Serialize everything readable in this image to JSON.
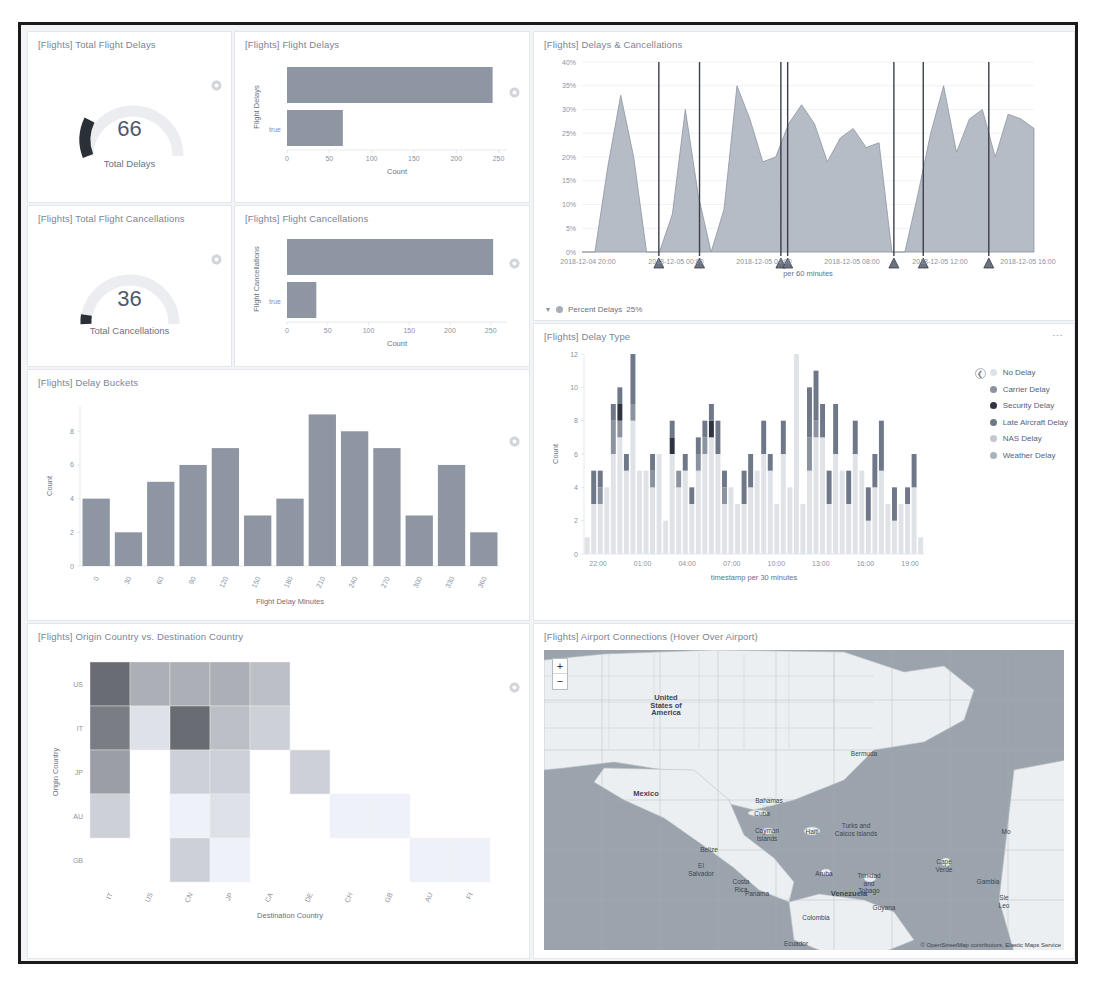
{
  "dashboard": {
    "attribution": "© OpenStreetMap contributors, Elastic Maps Service"
  },
  "panels": {
    "total_delays": {
      "title": "[Flights] Total Flight Delays",
      "value": "66",
      "label": "Total Delays",
      "gear_icon": "gear-icon"
    },
    "total_cancellations": {
      "title": "[Flights] Total Flight Cancellations",
      "value": "36",
      "label": "Total Cancellations",
      "gear_icon": "gear-icon"
    },
    "flight_delays": {
      "title": "[Flights] Flight Delays",
      "gear_icon": "gear-icon"
    },
    "flight_cancellations": {
      "title": "[Flights] Flight Cancellations",
      "gear_icon": "gear-icon"
    },
    "delays_cancellations": {
      "title": "[Flights] Delays & Cancellations",
      "legend_label": "Percent Delays",
      "legend_value": "25%",
      "chevron_icon": "chevron-down-icon"
    },
    "delay_type": {
      "title": "[Flights] Delay Type",
      "menu_icon": "panel-menu-icon"
    },
    "delay_buckets": {
      "title": "[Flights] Delay Buckets",
      "gear_icon": "gear-icon"
    },
    "origin_dest": {
      "title": "[Flights] Origin Country vs. Destination Country",
      "gear_icon": "gear-icon"
    },
    "airport_connections": {
      "title": "[Flights] Airport Connections (Hover Over Airport)",
      "zoom_in": "+",
      "zoom_out": "−",
      "zoom_in_icon": "zoom-in-icon",
      "zoom_out_icon": "zoom-out-icon"
    }
  },
  "map_labels": [
    {
      "text": "United\nStates of\nAmerica",
      "x": 122,
      "y": 44,
      "big": true
    },
    {
      "text": "Mexico",
      "x": 102,
      "y": 140,
      "big": true
    },
    {
      "text": "Bermuda",
      "x": 320,
      "y": 100,
      "big": false
    },
    {
      "text": "Bahamas",
      "x": 225,
      "y": 147,
      "big": false
    },
    {
      "text": "Cuba",
      "x": 218,
      "y": 160,
      "big": false
    },
    {
      "text": "Cayman\nIslands",
      "x": 223,
      "y": 177,
      "big": false
    },
    {
      "text": "Haiti",
      "x": 268,
      "y": 178,
      "big": false
    },
    {
      "text": "Belize",
      "x": 165,
      "y": 196,
      "big": false
    },
    {
      "text": "Turks and\nCaicos Islands",
      "x": 312,
      "y": 172,
      "big": false
    },
    {
      "text": "El\nSalvador",
      "x": 157,
      "y": 212,
      "big": false
    },
    {
      "text": "Costa\nRica",
      "x": 197,
      "y": 228,
      "big": false
    },
    {
      "text": "Panama",
      "x": 213,
      "y": 240,
      "big": false
    },
    {
      "text": "Aruba",
      "x": 280,
      "y": 220,
      "big": false
    },
    {
      "text": "Trinidad\nand\nTobago",
      "x": 325,
      "y": 222,
      "big": false
    },
    {
      "text": "Venezuela",
      "x": 305,
      "y": 240,
      "big": true
    },
    {
      "text": "Colombia",
      "x": 272,
      "y": 264,
      "big": false
    },
    {
      "text": "Guyana",
      "x": 340,
      "y": 254,
      "big": false
    },
    {
      "text": "Ecuador",
      "x": 252,
      "y": 290,
      "big": false
    },
    {
      "text": "Cape\nVerde",
      "x": 400,
      "y": 208,
      "big": false
    },
    {
      "text": "Gambia",
      "x": 444,
      "y": 228,
      "big": false
    },
    {
      "text": "Mo",
      "x": 462,
      "y": 178,
      "big": false
    },
    {
      "text": "Sie\nLeo",
      "x": 460,
      "y": 244,
      "big": false
    }
  ],
  "chart_data": [
    {
      "id": "flight_delays",
      "type": "bar",
      "orientation": "horizontal",
      "title": "[Flights] Flight Delays",
      "xlabel": "Count",
      "ylabel": "Flight Delays",
      "categories": [
        "false",
        "true"
      ],
      "values": [
        243,
        66
      ],
      "xlim": [
        0,
        260
      ],
      "xticks": [
        0,
        50,
        100,
        150,
        200,
        250
      ],
      "xticklabels": [
        "0",
        "50",
        "100",
        "150",
        "200",
        "250"
      ],
      "color": "#8e96a3"
    },
    {
      "id": "flight_cancellations",
      "type": "bar",
      "orientation": "horizontal",
      "title": "[Flights] Flight Cancellations",
      "xlabel": "Count",
      "ylabel": "Flight Cancellations",
      "categories": [
        "false",
        "true"
      ],
      "values": [
        253,
        36
      ],
      "xlim": [
        0,
        270
      ],
      "xticks": [
        0,
        50,
        100,
        150,
        200,
        250
      ],
      "xticklabels": [
        "0",
        "50",
        "100",
        "150",
        "200",
        "250"
      ],
      "color": "#8e96a3"
    },
    {
      "id": "delays_cancellations",
      "type": "area",
      "title": "[Flights] Delays & Cancellations",
      "xlabel": "per 60 minutes",
      "ylabel": "",
      "ylim": [
        0,
        40
      ],
      "yticks": [
        0,
        5,
        10,
        15,
        20,
        25,
        30,
        35,
        40
      ],
      "yticklabels": [
        "0%",
        "5%",
        "10%",
        "15%",
        "20%",
        "25%",
        "30%",
        "35%",
        "40%"
      ],
      "xticklabels": [
        "2018-12-04 20:00",
        "2018-12-05 00:00",
        "2018-12-05 04:00",
        "2018-12-05 08:00",
        "2018-12-05 12:00",
        "2018-12-05 16:00"
      ],
      "series": [
        {
          "name": "Percent Delays",
          "values": [
            0,
            0,
            18,
            33,
            20,
            0,
            0,
            8,
            30,
            12,
            0,
            9,
            35,
            28,
            19,
            20,
            27,
            31,
            27,
            19,
            24,
            26,
            22,
            23,
            0,
            0,
            12,
            25,
            35,
            21,
            28,
            30,
            20,
            29,
            28,
            26
          ]
        }
      ],
      "markers_percent": [
        0.17,
        0.26,
        0.44,
        0.455,
        0.69,
        0.755,
        0.9
      ],
      "legend_label": "Percent Delays",
      "legend_value": "25%",
      "color": "#9aa2ae"
    },
    {
      "id": "delay_type",
      "type": "bar",
      "stacked": true,
      "title": "[Flights] Delay Type",
      "xlabel": "timestamp per 30 minutes",
      "ylabel": "Count",
      "ylim": [
        0,
        12
      ],
      "yticks": [
        0,
        2,
        4,
        6,
        8,
        10,
        12
      ],
      "yticklabels": [
        "0",
        "2",
        "4",
        "6",
        "8",
        "10",
        "12"
      ],
      "xticklabels": [
        "22:00",
        "01:00",
        "04:00",
        "07:00",
        "10:00",
        "13:00",
        "16:00",
        "19:00"
      ],
      "legend": [
        {
          "name": "No Delay",
          "color": "#dfe2e7"
        },
        {
          "name": "Carrier Delay",
          "color": "#8b93a1"
        },
        {
          "name": "Security Delay",
          "color": "#2f3440"
        },
        {
          "name": "Late Aircraft Delay",
          "color": "#6f7889"
        },
        {
          "name": "NAS Delay",
          "color": "#c3c8d0"
        },
        {
          "name": "Weather Delay",
          "color": "#aab1bc"
        }
      ],
      "bars": [
        [
          1,
          0,
          0,
          0,
          0,
          0
        ],
        [
          3,
          0,
          0,
          2,
          0,
          0
        ],
        [
          3,
          1,
          0,
          1,
          0,
          0
        ],
        [
          4,
          0,
          0,
          0,
          0,
          0
        ],
        [
          6,
          2,
          0,
          1,
          0,
          0
        ],
        [
          7,
          1,
          1,
          1,
          0,
          0
        ],
        [
          5,
          0,
          0,
          1,
          0,
          0
        ],
        [
          8,
          1,
          0,
          3,
          0,
          0
        ],
        [
          5,
          0,
          0,
          0,
          0,
          0
        ],
        [
          5,
          0,
          0,
          0,
          0,
          0
        ],
        [
          4,
          1,
          0,
          1,
          0,
          0
        ],
        [
          6,
          0,
          0,
          0,
          0,
          0
        ],
        [
          2,
          0,
          0,
          0,
          0,
          0
        ],
        [
          6,
          0,
          1,
          1,
          0,
          0
        ],
        [
          4,
          1,
          0,
          0,
          0,
          0
        ],
        [
          5,
          0,
          0,
          1,
          0,
          0
        ],
        [
          3,
          0,
          0,
          1,
          0,
          0
        ],
        [
          5,
          1,
          0,
          1,
          0,
          0
        ],
        [
          6,
          1,
          0,
          1,
          0,
          0
        ],
        [
          7,
          0,
          1,
          1,
          0,
          0
        ],
        [
          6,
          0,
          0,
          2,
          0,
          0
        ],
        [
          3,
          1,
          0,
          1,
          0,
          0
        ],
        [
          4,
          0,
          0,
          0,
          0,
          0
        ],
        [
          3,
          0,
          0,
          0,
          0,
          0
        ],
        [
          3,
          0,
          0,
          2,
          0,
          0
        ],
        [
          4,
          0,
          0,
          2,
          0,
          0
        ],
        [
          5,
          0,
          0,
          0,
          0,
          0
        ],
        [
          6,
          0,
          0,
          2,
          0,
          0
        ],
        [
          5,
          0,
          0,
          1,
          0,
          0
        ],
        [
          3,
          0,
          0,
          0,
          0,
          0
        ],
        [
          6,
          0,
          0,
          2,
          0,
          0
        ],
        [
          4,
          0,
          0,
          0,
          0,
          0
        ],
        [
          12,
          0,
          0,
          0,
          0,
          0
        ],
        [
          3,
          0,
          0,
          0,
          0,
          0
        ],
        [
          5,
          2,
          0,
          3,
          0,
          0
        ],
        [
          7,
          1,
          0,
          3,
          0,
          0
        ],
        [
          7,
          0,
          0,
          2,
          0,
          0
        ],
        [
          3,
          0,
          0,
          2,
          0,
          0
        ],
        [
          6,
          0,
          0,
          3,
          0,
          0
        ],
        [
          5,
          0,
          0,
          0,
          0,
          0
        ],
        [
          3,
          0,
          0,
          2,
          0,
          0
        ],
        [
          6,
          0,
          0,
          2,
          0,
          0
        ],
        [
          5,
          0,
          0,
          0,
          0,
          0
        ],
        [
          2,
          0,
          0,
          2,
          0,
          0
        ],
        [
          4,
          0,
          0,
          2,
          0,
          0
        ],
        [
          5,
          0,
          0,
          3,
          0,
          0
        ],
        [
          3,
          0,
          0,
          0,
          0,
          0
        ],
        [
          2,
          0,
          0,
          2,
          0,
          0
        ],
        [
          3,
          0,
          0,
          0,
          0,
          0
        ],
        [
          3,
          0,
          0,
          1,
          0,
          0
        ],
        [
          4,
          0,
          0,
          2,
          0,
          0
        ],
        [
          1,
          0,
          0,
          0,
          0,
          0
        ]
      ]
    },
    {
      "id": "delay_buckets",
      "type": "bar",
      "title": "[Flights] Delay Buckets",
      "xlabel": "Flight Delay Minutes",
      "ylabel": "Count",
      "ylim": [
        0,
        9.5
      ],
      "yticks": [
        0,
        2,
        4,
        6,
        8
      ],
      "yticklabels": [
        "0",
        "2",
        "4",
        "6",
        "8"
      ],
      "categories": [
        "0",
        "30",
        "60",
        "90",
        "120",
        "150",
        "180",
        "210",
        "240",
        "270",
        "300",
        "330",
        "360"
      ],
      "values": [
        4,
        2,
        5,
        6,
        7,
        3,
        4,
        9,
        8,
        7,
        3,
        6,
        2
      ],
      "color": "#8e96a3"
    },
    {
      "id": "origin_dest",
      "type": "heatmap",
      "title": "[Flights] Origin Country vs. Destination Country",
      "xlabel": "Destination Country",
      "ylabel": "Origin Country",
      "yticklabels": [
        "US",
        "IT",
        "JP",
        "AU",
        "GB"
      ],
      "xticklabels": [
        "IT",
        "US",
        "CN",
        "JP",
        "CA",
        "DE",
        "CH",
        "GB",
        "AU",
        "FI"
      ],
      "matrix": [
        [
          9,
          5,
          5,
          5,
          4,
          0,
          0,
          0,
          0,
          0
        ],
        [
          8,
          2,
          9,
          4,
          3,
          0,
          0,
          0,
          0,
          0
        ],
        [
          6,
          0,
          3,
          3,
          0,
          3,
          0,
          0,
          0,
          0
        ],
        [
          3,
          0,
          1,
          2,
          0,
          0,
          1,
          1,
          0,
          0
        ],
        [
          0,
          0,
          3,
          1,
          0,
          0,
          0,
          0,
          1,
          1
        ]
      ],
      "max": 9
    }
  ]
}
